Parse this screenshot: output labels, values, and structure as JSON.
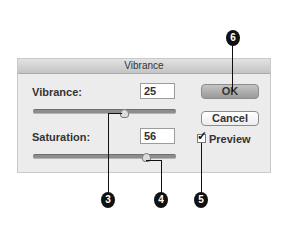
{
  "dialog": {
    "title": "Vibrance",
    "vibrance": {
      "label": "Vibrance:",
      "value": "25",
      "slider_percent": 64
    },
    "saturation": {
      "label": "Saturation:",
      "value": "56",
      "slider_percent": 78
    },
    "buttons": {
      "ok": "OK",
      "cancel": "Cancel"
    },
    "preview": {
      "label": "Preview",
      "checked": true,
      "check_glyph": "✓"
    }
  },
  "callouts": [
    {
      "number": "6",
      "target": "ok-button"
    },
    {
      "number": "3",
      "target": "vibrance-slider"
    },
    {
      "number": "4",
      "target": "saturation-slider"
    },
    {
      "number": "5",
      "target": "preview-checkbox"
    }
  ],
  "colors": {
    "callout_bg": "#111111",
    "dialog_bg": "#ececec"
  }
}
